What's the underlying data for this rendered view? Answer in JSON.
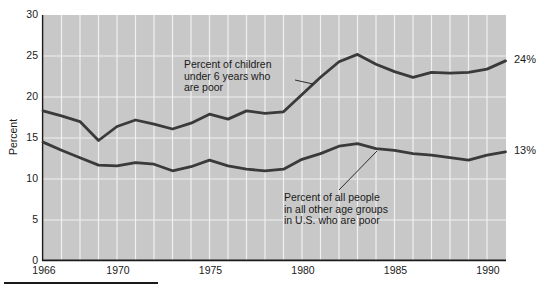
{
  "figure": {
    "background": "#ffffff",
    "plot_bg": "#c8c8c8",
    "grid_color": "#f0f0f0",
    "line_color": "#3a3a3a",
    "axis_color": "#1a1a1a"
  },
  "chart_data": {
    "type": "line",
    "title": "",
    "xlabel": "",
    "ylabel": "Percent",
    "xlim": [
      1966,
      1991
    ],
    "ylim": [
      0,
      30
    ],
    "grid": true,
    "x_ticks": [
      1966,
      1970,
      1975,
      1980,
      1985,
      1990
    ],
    "y_ticks": [
      0,
      5,
      10,
      15,
      20,
      25,
      30
    ],
    "years": [
      1966,
      1967,
      1968,
      1969,
      1970,
      1971,
      1972,
      1973,
      1974,
      1975,
      1976,
      1977,
      1978,
      1979,
      1980,
      1981,
      1982,
      1983,
      1984,
      1985,
      1986,
      1987,
      1988,
      1989,
      1990,
      1991
    ],
    "series": [
      {
        "id": "children-under-6",
        "name": "Percent of children under 6 years who are poor",
        "end_label": "24%",
        "values": [
          18.3,
          17.7,
          17.0,
          14.7,
          16.4,
          17.2,
          16.7,
          16.1,
          16.8,
          17.9,
          17.3,
          18.3,
          18.0,
          18.2,
          20.3,
          22.4,
          24.3,
          25.2,
          24.0,
          23.1,
          22.4,
          23.0,
          22.9,
          23.0,
          23.4,
          24.4
        ]
      },
      {
        "id": "all-other-age-groups",
        "name": "Percent of all people in all other age groups in U.S. who are poor",
        "end_label": "13%",
        "values": [
          14.5,
          13.5,
          12.6,
          11.7,
          11.6,
          12.0,
          11.8,
          11.0,
          11.5,
          12.3,
          11.6,
          11.2,
          11.0,
          11.2,
          12.4,
          13.1,
          14.0,
          14.3,
          13.7,
          13.5,
          13.1,
          12.9,
          12.6,
          12.3,
          12.9,
          13.3
        ]
      }
    ],
    "annotations": [
      {
        "id": "children-label",
        "lines": [
          "Percent of children",
          "under 6 years who",
          "are poor"
        ],
        "x": 184,
        "y": 59,
        "leader": {
          "x1": 295,
          "y1": 80,
          "x2": 313,
          "y2": 84
        }
      },
      {
        "id": "others-label",
        "lines": [
          "Percent of all people",
          "in all other age groups",
          "in U.S. who are poor"
        ],
        "x": 284,
        "y": 192,
        "leader": {
          "x1": 339,
          "y1": 190,
          "x2": 377,
          "y2": 151
        }
      }
    ]
  }
}
